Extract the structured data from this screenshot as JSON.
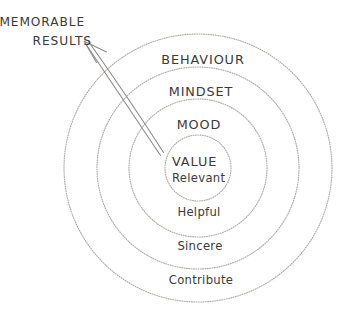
{
  "diagram": {
    "background_color": "#ffffff",
    "ink_color": "#3a3a3a",
    "ring_stroke_color": "#b0aca8",
    "arrow_color": "#8d8a88",
    "center": {
      "x": 198,
      "y": 168
    },
    "callout": {
      "line1": "MEMORABLE",
      "line2": "RESULTS"
    },
    "rings": [
      {
        "index": 1,
        "label": "BEHAVIOUR",
        "case": "caps",
        "radius": 134,
        "label_x": 203,
        "label_y": 64
      },
      {
        "index": 2,
        "label": "MINDSET",
        "case": "caps",
        "radius": 101,
        "label_x": 201,
        "label_y": 96
      },
      {
        "index": 3,
        "label": "MOOD",
        "case": "caps",
        "radius": 69,
        "label_x": 199,
        "label_y": 129
      },
      {
        "index": 4,
        "label": "Helpful",
        "case": "lower",
        "radius": 69,
        "label_x": 199,
        "label_y": 216
      },
      {
        "index": 5,
        "label": "Sincere",
        "case": "lower",
        "radius": 101,
        "label_x": 200,
        "label_y": 250
      },
      {
        "index": 6,
        "label": "Contribute",
        "case": "lower",
        "radius": 134,
        "label_x": 201,
        "label_y": 284
      }
    ],
    "core": {
      "radius": 33,
      "label": "VALUE",
      "sublabel": "Relevant",
      "label_x": 172,
      "label_y": 166,
      "sublabel_y": 182
    }
  }
}
